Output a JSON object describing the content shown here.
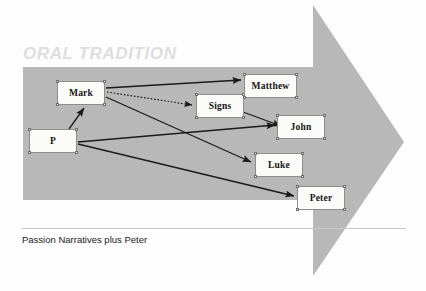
{
  "figure": {
    "background_color": "#fdfdfd",
    "arrow_color": "#b8b8b8",
    "box_fill": "#fbfbf9",
    "box_border": "#8d8d8d",
    "line_color": "#1a1a1a"
  },
  "banner": {
    "label": "ORAL TRADITION",
    "color": "#dedede"
  },
  "caption": {
    "text": "Passion Narratives plus Peter"
  },
  "nodes": [
    {
      "id": "mark",
      "label": "Mark",
      "x": 57,
      "y": 81,
      "w": 48,
      "h": 24
    },
    {
      "id": "p",
      "label": "P",
      "x": 29,
      "y": 129,
      "w": 48,
      "h": 24
    },
    {
      "id": "signs",
      "label": "Signs",
      "x": 196,
      "y": 94,
      "w": 48,
      "h": 24
    },
    {
      "id": "matthew",
      "label": "Matthew",
      "x": 244,
      "y": 74,
      "w": 53,
      "h": 24
    },
    {
      "id": "john",
      "label": "John",
      "x": 277,
      "y": 115,
      "w": 48,
      "h": 24
    },
    {
      "id": "luke",
      "label": "Luke",
      "x": 255,
      "y": 153,
      "w": 48,
      "h": 24
    },
    {
      "id": "peter",
      "label": "Peter",
      "x": 297,
      "y": 186,
      "w": 48,
      "h": 24
    }
  ],
  "edges": [
    {
      "id": "mark-matthew",
      "from": "Mark",
      "to": "Matthew",
      "style": "solid",
      "arrowhead": true
    },
    {
      "id": "mark-signs",
      "from": "Mark",
      "to": "Signs",
      "style": "dotted",
      "arrowhead": true
    },
    {
      "id": "mark-luke",
      "from": "Mark",
      "to": "Luke",
      "style": "solid",
      "arrowhead": true
    },
    {
      "id": "signs-john",
      "from": "Signs",
      "to": "John",
      "style": "solid",
      "arrowhead": true
    },
    {
      "id": "p-mark",
      "from": "P",
      "to": "Mark",
      "style": "solid",
      "arrowhead": true
    },
    {
      "id": "p-john",
      "from": "P",
      "to": "John",
      "style": "solid",
      "arrowhead": true
    },
    {
      "id": "p-peter",
      "from": "P",
      "to": "Peter",
      "style": "solid",
      "arrowhead": true
    }
  ]
}
